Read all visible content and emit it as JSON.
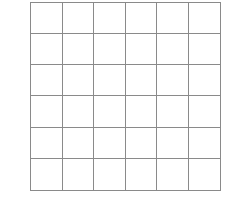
{
  "grid": {
    "rows": 6,
    "cols": 6,
    "line_color": "#8a8a8a",
    "fill_color": "#ffffff"
  }
}
